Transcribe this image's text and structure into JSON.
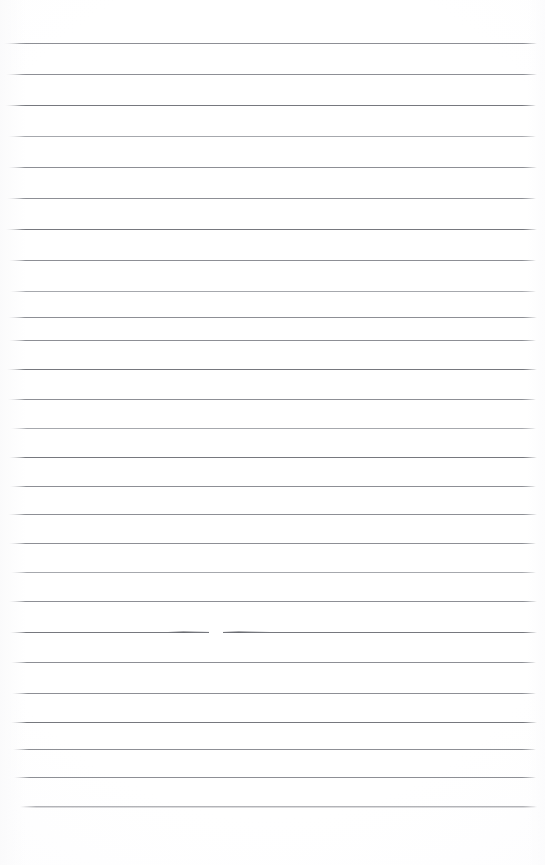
{
  "document": {
    "type": "lined-notebook-page",
    "title": "Blank ruled notebook page",
    "page_width": 545,
    "page_height": 865,
    "background_color": "#ffffff",
    "rule_color": "#8d8f95",
    "rule_color_light": "#a6a8ad",
    "rule_color_dark": "#76787e",
    "content_text": "",
    "handwriting_present": "none",
    "ruled_lines": {
      "count": 27,
      "left_x": 6,
      "right_x": 537,
      "nominal_spacing": 29,
      "items": [
        {
          "y": 43,
          "weight": "normal",
          "left": 4,
          "right": 537
        },
        {
          "y": 74,
          "weight": "normal",
          "left": 6,
          "right": 537
        },
        {
          "y": 105,
          "weight": "dark",
          "left": 5,
          "right": 536
        },
        {
          "y": 136,
          "weight": "light",
          "left": 8,
          "right": 536
        },
        {
          "y": 167,
          "weight": "normal",
          "left": 8,
          "right": 537
        },
        {
          "y": 198,
          "weight": "normal",
          "left": 7,
          "right": 536
        },
        {
          "y": 229,
          "weight": "dark",
          "left": 6,
          "right": 537
        },
        {
          "y": 260,
          "weight": "normal",
          "left": 9,
          "right": 536
        },
        {
          "y": 291,
          "weight": "light",
          "left": 10,
          "right": 536
        },
        {
          "y": 317,
          "weight": "normal",
          "left": 8,
          "right": 537
        },
        {
          "y": 340,
          "weight": "normal",
          "left": 9,
          "right": 536
        },
        {
          "y": 369,
          "weight": "dark",
          "left": 7,
          "right": 537
        },
        {
          "y": 399,
          "weight": "normal",
          "left": 8,
          "right": 536
        },
        {
          "y": 428,
          "weight": "light",
          "left": 11,
          "right": 536
        },
        {
          "y": 457,
          "weight": "dark",
          "left": 9,
          "right": 537
        },
        {
          "y": 486,
          "weight": "normal",
          "left": 10,
          "right": 536
        },
        {
          "y": 514,
          "weight": "normal",
          "left": 8,
          "right": 537
        },
        {
          "y": 543,
          "weight": "normal",
          "left": 9,
          "right": 536
        },
        {
          "y": 572,
          "weight": "light",
          "left": 11,
          "right": 536
        },
        {
          "y": 601,
          "weight": "normal",
          "left": 9,
          "right": 537
        },
        {
          "y": 632,
          "weight": "dark",
          "left": 10,
          "right": 537
        },
        {
          "y": 662,
          "weight": "normal",
          "left": 11,
          "right": 536
        },
        {
          "y": 693,
          "weight": "normal",
          "left": 12,
          "right": 536
        },
        {
          "y": 722,
          "weight": "dark",
          "left": 11,
          "right": 537
        },
        {
          "y": 749,
          "weight": "normal",
          "left": 13,
          "right": 536
        },
        {
          "y": 777,
          "weight": "normal",
          "left": 14,
          "right": 536
        },
        {
          "y": 806,
          "weight": "fuzzy",
          "left": 20,
          "right": 537
        }
      ]
    },
    "ink_marks": [
      {
        "name": "mid-page-smudge-left",
        "x": 168,
        "y": 631,
        "width": 44,
        "kind": "smudge"
      },
      {
        "name": "mid-page-smudge-right",
        "x": 222,
        "y": 631,
        "width": 48,
        "kind": "smudge"
      },
      {
        "name": "mid-page-line-gap",
        "x": 209,
        "y": 630,
        "width": 14,
        "kind": "gap"
      }
    ],
    "margins": {
      "top_blank_px": 43,
      "bottom_blank_px": 59,
      "left_blank_px": 6,
      "right_blank_px": 8
    }
  }
}
